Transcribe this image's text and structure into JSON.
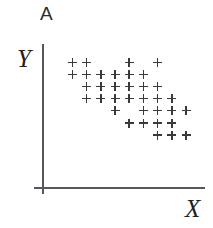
{
  "figure": {
    "panel_label": "A",
    "background_color": "#ffffff"
  },
  "axes": {
    "y_axis_label": "Y",
    "x_axis_label": "X",
    "axis_color": "#56565c",
    "ticks": [],
    "tick_labels": [],
    "grid": false
  },
  "chart_data": {
    "type": "scatter",
    "title": "A",
    "xlabel": "X",
    "ylabel": "Y",
    "grid": false,
    "legend": null,
    "marker": "plus",
    "marker_color": "#3a3a3a",
    "xlim": [
      0,
      9
    ],
    "ylim": [
      0,
      8
    ],
    "x_tick_labels": [],
    "y_tick_labels": [],
    "n_points": 35,
    "column_count": 9,
    "row_count": 7,
    "rows": [
      {
        "row": 1,
        "columns": [
          0,
          1,
          4,
          6
        ]
      },
      {
        "row": 2,
        "columns": [
          0,
          1,
          2,
          3,
          4,
          5
        ]
      },
      {
        "row": 3,
        "columns": [
          1,
          2,
          3,
          4,
          5,
          6
        ]
      },
      {
        "row": 4,
        "columns": [
          1,
          2,
          3,
          4,
          5,
          6,
          7
        ]
      },
      {
        "row": 5,
        "columns": [
          3,
          5,
          6,
          7,
          8
        ]
      },
      {
        "row": 6,
        "columns": [
          4,
          5,
          6,
          7
        ]
      },
      {
        "row": 7,
        "columns": [
          6,
          7,
          8
        ]
      }
    ],
    "points": [
      {
        "x": 0,
        "y": 7
      },
      {
        "x": 1,
        "y": 7
      },
      {
        "x": 4,
        "y": 7
      },
      {
        "x": 6,
        "y": 7
      },
      {
        "x": 0,
        "y": 6
      },
      {
        "x": 1,
        "y": 6
      },
      {
        "x": 2,
        "y": 6
      },
      {
        "x": 3,
        "y": 6
      },
      {
        "x": 4,
        "y": 6
      },
      {
        "x": 5,
        "y": 6
      },
      {
        "x": 1,
        "y": 5
      },
      {
        "x": 2,
        "y": 5
      },
      {
        "x": 3,
        "y": 5
      },
      {
        "x": 4,
        "y": 5
      },
      {
        "x": 5,
        "y": 5
      },
      {
        "x": 6,
        "y": 5
      },
      {
        "x": 1,
        "y": 4
      },
      {
        "x": 2,
        "y": 4
      },
      {
        "x": 3,
        "y": 4
      },
      {
        "x": 4,
        "y": 4
      },
      {
        "x": 5,
        "y": 4
      },
      {
        "x": 6,
        "y": 4
      },
      {
        "x": 7,
        "y": 4
      },
      {
        "x": 3,
        "y": 3
      },
      {
        "x": 5,
        "y": 3
      },
      {
        "x": 6,
        "y": 3
      },
      {
        "x": 7,
        "y": 3
      },
      {
        "x": 8,
        "y": 3
      },
      {
        "x": 4,
        "y": 2
      },
      {
        "x": 5,
        "y": 2
      },
      {
        "x": 6,
        "y": 2
      },
      {
        "x": 7,
        "y": 2
      },
      {
        "x": 6,
        "y": 1
      },
      {
        "x": 7,
        "y": 1
      },
      {
        "x": 8,
        "y": 1
      }
    ]
  },
  "layout": {
    "origin_x_px": 68,
    "origin_y_px": 58,
    "col_step_px": 14.2,
    "row_step_px": 12.1
  }
}
